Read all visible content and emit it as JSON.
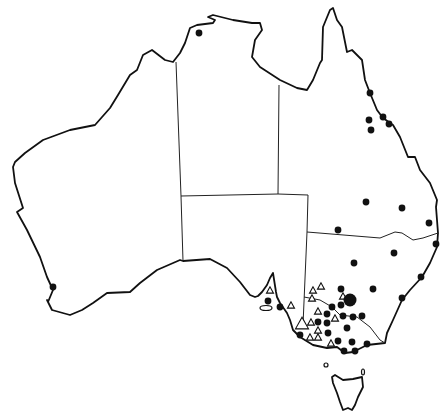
{
  "map": {
    "title": "Australia distribution map",
    "region": "Australia",
    "width": 446,
    "height": 418,
    "colors": {
      "background": "#ffffff",
      "outline": "#111111",
      "filled_marker": "#111111",
      "open_marker": "#ffffff"
    },
    "legend": [
      {
        "symbol": "filled-circle",
        "label": ""
      },
      {
        "symbol": "open-triangle",
        "label": ""
      }
    ],
    "dots": [
      {
        "x": 199,
        "y": 33,
        "r": 3.4
      },
      {
        "x": 370,
        "y": 93,
        "r": 3.4
      },
      {
        "x": 369,
        "y": 120,
        "r": 3.4
      },
      {
        "x": 371,
        "y": 130,
        "r": 3.4
      },
      {
        "x": 383,
        "y": 117,
        "r": 3.4
      },
      {
        "x": 389,
        "y": 124,
        "r": 3.4
      },
      {
        "x": 366,
        "y": 202,
        "r": 3.4
      },
      {
        "x": 402,
        "y": 208,
        "r": 3.4
      },
      {
        "x": 429,
        "y": 223,
        "r": 3.4
      },
      {
        "x": 338,
        "y": 230,
        "r": 3.4
      },
      {
        "x": 436,
        "y": 244,
        "r": 3.4
      },
      {
        "x": 394,
        "y": 253,
        "r": 3.4
      },
      {
        "x": 354,
        "y": 263,
        "r": 3.4
      },
      {
        "x": 421,
        "y": 277,
        "r": 3.4
      },
      {
        "x": 341,
        "y": 289,
        "r": 3.4
      },
      {
        "x": 373,
        "y": 289,
        "r": 3.4
      },
      {
        "x": 402,
        "y": 298,
        "r": 3.4
      },
      {
        "x": 350,
        "y": 300,
        "r": 6.5
      },
      {
        "x": 341,
        "y": 305,
        "r": 3.4
      },
      {
        "x": 332,
        "y": 307,
        "r": 3.4
      },
      {
        "x": 327,
        "y": 314,
        "r": 3.4
      },
      {
        "x": 343,
        "y": 316,
        "r": 3.4
      },
      {
        "x": 353,
        "y": 317,
        "r": 3.4
      },
      {
        "x": 362,
        "y": 316,
        "r": 3.4
      },
      {
        "x": 318,
        "y": 322,
        "r": 3.4
      },
      {
        "x": 327,
        "y": 323,
        "r": 3.4
      },
      {
        "x": 347,
        "y": 328,
        "r": 3.4
      },
      {
        "x": 328,
        "y": 333,
        "r": 3.4
      },
      {
        "x": 300,
        "y": 335,
        "r": 3.4
      },
      {
        "x": 338,
        "y": 341,
        "r": 3.4
      },
      {
        "x": 352,
        "y": 342,
        "r": 3.4
      },
      {
        "x": 367,
        "y": 344,
        "r": 3.4
      },
      {
        "x": 344,
        "y": 351,
        "r": 3.4
      },
      {
        "x": 355,
        "y": 351,
        "r": 3.4
      },
      {
        "x": 268,
        "y": 301,
        "r": 3.4
      },
      {
        "x": 280,
        "y": 307,
        "r": 3.4
      },
      {
        "x": 53,
        "y": 287,
        "r": 3.4
      }
    ],
    "triangles": [
      {
        "x": 270,
        "y": 290,
        "s": 7
      },
      {
        "x": 291,
        "y": 305,
        "s": 7
      },
      {
        "x": 313,
        "y": 290,
        "s": 7
      },
      {
        "x": 321,
        "y": 286,
        "s": 7
      },
      {
        "x": 312,
        "y": 298,
        "s": 7
      },
      {
        "x": 343,
        "y": 296,
        "s": 7
      },
      {
        "x": 318,
        "y": 311,
        "s": 7
      },
      {
        "x": 335,
        "y": 318,
        "s": 7
      },
      {
        "x": 311,
        "y": 322,
        "s": 7
      },
      {
        "x": 318,
        "y": 330,
        "s": 7
      },
      {
        "x": 310,
        "y": 337,
        "s": 7
      },
      {
        "x": 318,
        "y": 337,
        "s": 7
      },
      {
        "x": 331,
        "y": 343,
        "s": 7
      },
      {
        "x": 302,
        "y": 323,
        "s": 13
      }
    ],
    "islands": [
      {
        "name": "kangaroo-island",
        "cx": 266,
        "cy": 308,
        "rx": 6,
        "ry": 2.5
      },
      {
        "name": "king-island",
        "cx": 326,
        "cy": 365,
        "rx": 2,
        "ry": 2
      },
      {
        "name": "flinders-island",
        "cx": 363,
        "cy": 372,
        "rx": 1.5,
        "ry": 3
      }
    ]
  }
}
